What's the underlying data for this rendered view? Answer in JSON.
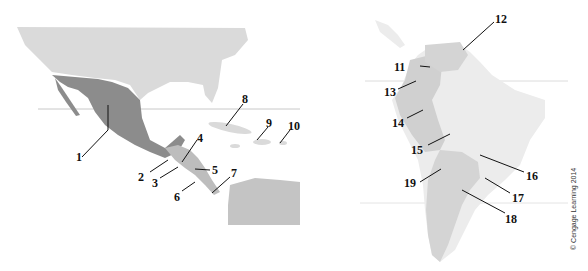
{
  "maps": [
    {
      "name": "Mexico, Central America and Caribbean",
      "labels": [
        "1",
        "2",
        "3",
        "4",
        "5",
        "6",
        "7",
        "8",
        "9",
        "10"
      ]
    },
    {
      "name": "South America",
      "labels": [
        "11",
        "12",
        "13",
        "14",
        "15",
        "16",
        "17",
        "18",
        "19"
      ]
    }
  ],
  "labels": {
    "l1": "1",
    "l2": "2",
    "l3": "3",
    "l4": "4",
    "l5": "5",
    "l6": "6",
    "l7": "7",
    "l8": "8",
    "l9": "9",
    "l10": "10",
    "l11": "11",
    "l12": "12",
    "l13": "13",
    "l14": "14",
    "l15": "15",
    "l16": "16",
    "l17": "17",
    "l18": "18",
    "l19": "19"
  },
  "credit": "© Cengage Learning 2014",
  "colors": {
    "highlight": "#8c8c8c",
    "land_light": "#d9d9d9",
    "land_lighter": "#ececec",
    "label": "#111111"
  }
}
